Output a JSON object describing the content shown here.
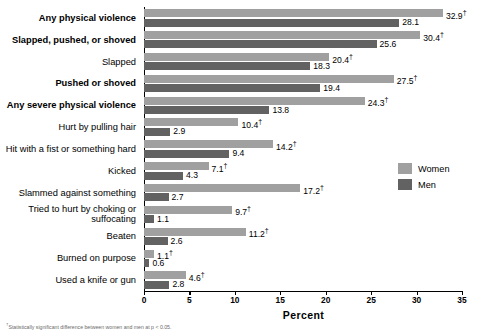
{
  "chart_data": {
    "type": "bar",
    "orientation": "horizontal",
    "title": "",
    "xlabel": "Percent",
    "ylabel": "",
    "xlim": [
      0,
      35
    ],
    "xticks": [
      0,
      5,
      10,
      15,
      20,
      25,
      30,
      35
    ],
    "grid": false,
    "legend_position": "right",
    "categories": [
      "Any physical violence",
      "Slapped, pushed, or shoved",
      "Slapped",
      "Pushed or shoved",
      "Any severe physical violence",
      "Hurt by pulling hair",
      "Hit with a fist or something hard",
      "Kicked",
      "Slammed against something",
      "Tried to hurt by choking or suffocating",
      "Beaten",
      "Burned on purpose",
      "Used a knife or gun"
    ],
    "series": [
      {
        "name": "Women",
        "color": "#a0a0a0",
        "values": [
          32.9,
          30.4,
          20.4,
          27.5,
          24.3,
          10.4,
          14.2,
          7.1,
          17.2,
          9.7,
          11.2,
          1.1,
          4.6
        ],
        "labels": [
          "32.9",
          "30.4",
          "20.4",
          "27.5",
          "24.3",
          "10.4",
          "14.2",
          "7.1",
          "17.2",
          "9.7",
          "11.2",
          "1.1",
          "4.6"
        ],
        "dagger": [
          true,
          true,
          true,
          true,
          true,
          true,
          true,
          true,
          true,
          true,
          true,
          true,
          true
        ]
      },
      {
        "name": "Men",
        "color": "#626262",
        "values": [
          28.1,
          25.6,
          18.3,
          19.4,
          13.8,
          2.9,
          9.4,
          4.3,
          2.7,
          1.1,
          2.6,
          0.6,
          2.8
        ],
        "labels": [
          "28.1",
          "25.6",
          "18.3",
          "19.4",
          "13.8",
          "2.9",
          "9.4",
          "4.3",
          "2.7",
          "1.1",
          "2.6",
          "0.6",
          "2.8"
        ],
        "dagger": [
          false,
          false,
          false,
          false,
          false,
          false,
          false,
          false,
          false,
          false,
          false,
          false,
          false
        ]
      }
    ],
    "bold_categories": [
      "Any physical violence",
      "Slapped, pushed, or shoved",
      "Pushed or shoved",
      "Any severe physical violence"
    ],
    "dagger_symbol": "†"
  },
  "legend": {
    "items": [
      {
        "label": "Women",
        "color": "#a0a0a0"
      },
      {
        "label": "Men",
        "color": "#626262"
      }
    ]
  },
  "axis": {
    "x_title": "Percent",
    "x_tick_labels": [
      "0",
      "5",
      "10",
      "15",
      "20",
      "25",
      "30",
      "35"
    ]
  },
  "footnote": {
    "text": "†Statistically significant difference between women and men at p < 0.05."
  }
}
